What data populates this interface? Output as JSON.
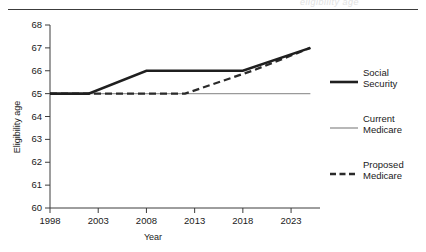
{
  "figure": {
    "ghost_text": "eligibility age",
    "rule_color": "#3c3c3c"
  },
  "axes": {
    "ylabel": "Eligibility age",
    "xlabel": "Year",
    "yticks": [
      "68",
      "67",
      "66",
      "65",
      "64",
      "63",
      "62",
      "61",
      "60"
    ],
    "xticks": [
      "1998",
      "2003",
      "2008",
      "2013",
      "2018",
      "2023"
    ]
  },
  "legend": {
    "items": [
      {
        "name": "social-security",
        "line1": "Social",
        "line2": "Security",
        "color": "#1f1f1f",
        "style": "solid",
        "width": 2.6
      },
      {
        "name": "current-medicare",
        "line1": "Current",
        "line2": "Medicare",
        "color": "#9a9a9a",
        "style": "solid",
        "width": 1.4
      },
      {
        "name": "proposed-medicare",
        "line1": "Proposed",
        "line2": "Medicare",
        "color": "#2a2a2a",
        "style": "dashed",
        "width": 2.3
      }
    ]
  },
  "chart_data": {
    "type": "line",
    "title": "",
    "xlabel": "Year",
    "ylabel": "Eligibility age",
    "xlim": [
      1998,
      2026
    ],
    "ylim": [
      60,
      68
    ],
    "xticks": [
      1998,
      2003,
      2008,
      2013,
      2018,
      2023
    ],
    "yticks": [
      60,
      61,
      62,
      63,
      64,
      65,
      66,
      67,
      68
    ],
    "grid": false,
    "legend_position": "right",
    "series": [
      {
        "name": "Social Security",
        "color": "#1f1f1f",
        "style": "solid",
        "width": 2.6,
        "x": [
          1998,
          2002,
          2008,
          2018,
          2025
        ],
        "y": [
          65,
          65,
          66,
          66,
          67
        ]
      },
      {
        "name": "Current Medicare",
        "color": "#9a9a9a",
        "style": "solid",
        "width": 1.4,
        "x": [
          1998,
          2025
        ],
        "y": [
          65,
          65
        ]
      },
      {
        "name": "Proposed Medicare",
        "color": "#2a2a2a",
        "style": "dashed",
        "width": 2.3,
        "x": [
          1998,
          2012,
          2019,
          2025
        ],
        "y": [
          65,
          65,
          66,
          67
        ]
      }
    ]
  }
}
